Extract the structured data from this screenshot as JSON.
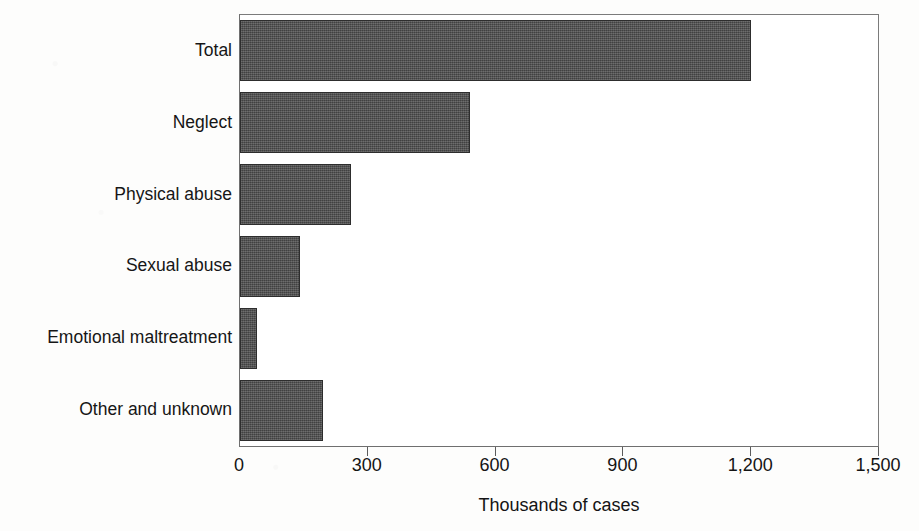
{
  "chart_data": {
    "type": "bar",
    "orientation": "horizontal",
    "title": "",
    "subtitle": "",
    "xlabel": "Thousands of cases",
    "ylabel": "",
    "categories": [
      "Total",
      "Neglect",
      "Physical abuse",
      "Sexual abuse",
      "Emotional maltreatment",
      "Other and unknown"
    ],
    "values": [
      1200,
      540,
      260,
      140,
      40,
      195
    ],
    "series": [
      {
        "name": "Reported cases",
        "values": [
          1200,
          540,
          260,
          140,
          40,
          195
        ]
      }
    ],
    "xlim": [
      0,
      1500
    ],
    "x_ticks": [
      0,
      300,
      600,
      900,
      1200,
      1500
    ],
    "x_tick_labels": [
      "0",
      "300",
      "600",
      "900",
      "1,200",
      "1,500"
    ],
    "grid": false,
    "legend": false,
    "legend_position": "none",
    "annotations": [],
    "bar_color": "#4e4e4e",
    "bar_edge_color": "#2d2d2d",
    "axis_color": "#6f6f6f",
    "text_color": "#141414",
    "plot_background": "#ffffff",
    "page_background": "#fdfdfc"
  }
}
